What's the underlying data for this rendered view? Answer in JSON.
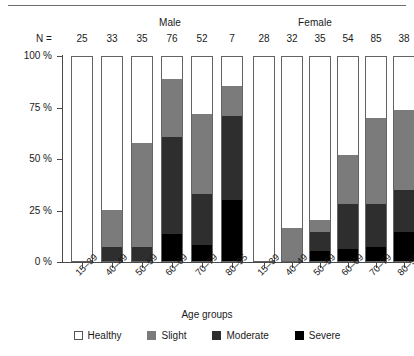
{
  "chart_data": {
    "type": "bar",
    "subtype": "stacked-percent",
    "title": "",
    "xlabel": "Age groups",
    "ylabel": "",
    "ylim": [
      0,
      100
    ],
    "ytick_labels": [
      "0 %",
      "25 %",
      "50 %",
      "75 %",
      "100 %"
    ],
    "ytick_values": [
      0,
      25,
      50,
      75,
      100
    ],
    "grid": false,
    "legend_position": "bottom",
    "group_labels": [
      "Male",
      "Female"
    ],
    "n_label": "N =",
    "categories": [
      "15–39",
      "40–49",
      "50–59",
      "60–69",
      "70–79",
      "80–95"
    ],
    "legend_entries": [
      "Healthy",
      "Slight",
      "Moderate",
      "Severe"
    ],
    "colors": {
      "healthy": "#ffffff",
      "slight": "#7b7b7b",
      "moderate": "#2e2e2e",
      "severe": "#000000",
      "axis": "#4a4a4a",
      "bar_outline": "#636363"
    },
    "groups": [
      {
        "name": "Male",
        "bars": [
          {
            "category": "15–39",
            "n": 25,
            "severe": 0,
            "moderate": 0,
            "slight": 0,
            "healthy": 100
          },
          {
            "category": "40–49",
            "n": 33,
            "severe": 0,
            "moderate": 7,
            "slight": 18,
            "healthy": 75
          },
          {
            "category": "50–59",
            "n": 35,
            "severe": 0,
            "moderate": 7,
            "slight": 51,
            "healthy": 42
          },
          {
            "category": "60–69",
            "n": 76,
            "severe": 13,
            "moderate": 48,
            "slight": 28,
            "healthy": 11
          },
          {
            "category": "70–79",
            "n": 52,
            "severe": 8,
            "moderate": 25,
            "slight": 39,
            "healthy": 28
          },
          {
            "category": "80–95",
            "n": 7,
            "severe": 30,
            "moderate": 41,
            "slight": 15,
            "healthy": 14
          }
        ]
      },
      {
        "name": "Female",
        "bars": [
          {
            "category": "15–39",
            "n": 28,
            "severe": 0,
            "moderate": 0,
            "slight": 0,
            "healthy": 100
          },
          {
            "category": "40–49",
            "n": 32,
            "severe": 0,
            "moderate": 0,
            "slight": 16,
            "healthy": 84
          },
          {
            "category": "50–59",
            "n": 35,
            "severe": 5,
            "moderate": 9,
            "slight": 6,
            "healthy": 80
          },
          {
            "category": "60–69",
            "n": 54,
            "severe": 6,
            "moderate": 22,
            "slight": 24,
            "healthy": 48
          },
          {
            "category": "70–79",
            "n": 85,
            "severe": 7,
            "moderate": 21,
            "slight": 42,
            "healthy": 30
          },
          {
            "category": "80–95",
            "n": 38,
            "severe": 14,
            "moderate": 21,
            "slight": 39,
            "healthy": 26
          }
        ]
      }
    ]
  }
}
